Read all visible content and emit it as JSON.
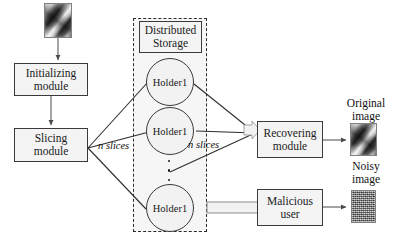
{
  "diagram": {
    "nodes": {
      "initializing_module": "Initializing\nmodule",
      "initializing_module_line1": "Initializing",
      "initializing_module_line2": "module",
      "slicing_module_line1": "Slicing",
      "slicing_module_line2": "module",
      "distributed_storage_line1": "Distributed",
      "distributed_storage_line2": "Storage",
      "holder_1": "Holder1",
      "holder_2": "Holder1",
      "holder_3": "Holder1",
      "recovering_module_line1": "Recovering",
      "recovering_module_line2": "module",
      "malicious_user_line1": "Malicious",
      "malicious_user_line2": "user"
    },
    "edge_labels": {
      "slicing_out": "n slices",
      "recovering_in": "n slices"
    },
    "captions": {
      "original_image_line1": "Original",
      "original_image_line2": "image",
      "noisy_image_line1": "Noisy",
      "noisy_image_line2": "image"
    },
    "images": {
      "input_thumbnail": "grayscale-photo",
      "original_output_thumbnail": "grayscale-photo",
      "noisy_output_thumbnail": "gray-noise-block"
    },
    "ellipsis": "vertical-dots",
    "colors": {
      "stroke": "#3a3a3a",
      "node_fill": "#f4f4f4",
      "region_fill": "#f6f6f6",
      "text": "#111111",
      "background": "#ffffff"
    }
  }
}
